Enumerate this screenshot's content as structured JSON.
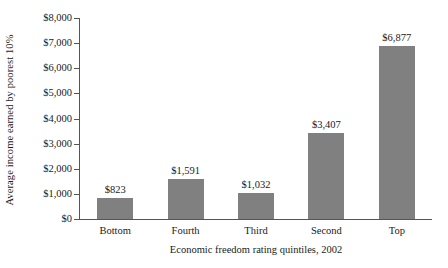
{
  "chart_data": {
    "type": "bar",
    "title": "",
    "categories": [
      "Bottom",
      "Fourth",
      "Third",
      "Second",
      "Top"
    ],
    "values": [
      823,
      1591,
      1032,
      3407,
      6877
    ],
    "value_labels": [
      "$823",
      "$1,591",
      "$1,032",
      "$3,407",
      "$6,877"
    ],
    "xlabel": "Economic freedom rating quintiles, 2002",
    "ylabel": "Average income earned by poorest 10%",
    "ylim": [
      0,
      8000
    ],
    "ytick_values": [
      0,
      1000,
      2000,
      3000,
      4000,
      5000,
      6000,
      7000,
      8000
    ],
    "ytick_labels": [
      "$0",
      "$1,000",
      "$2,000",
      "$3,000",
      "$4,000",
      "$5,000",
      "$6,000",
      "$7,000",
      "$8,000"
    ],
    "grid": false,
    "legend": false,
    "bar_color": "#808080",
    "axis_color": "#555555",
    "background_color": "#ffffff"
  }
}
